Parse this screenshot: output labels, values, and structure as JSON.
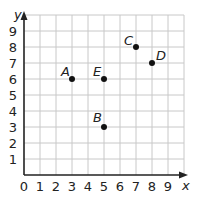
{
  "chart_data": {
    "type": "scatter",
    "title": "",
    "xlabel": "x",
    "ylabel": "y",
    "xlim": [
      0,
      9
    ],
    "ylim": [
      0,
      9
    ],
    "grid": true,
    "x_ticks": [
      "0",
      "1",
      "2",
      "3",
      "4",
      "5",
      "6",
      "7",
      "8",
      "9"
    ],
    "y_ticks": [
      "1",
      "2",
      "3",
      "4",
      "5",
      "6",
      "7",
      "8",
      "9"
    ],
    "points": [
      {
        "label": "A",
        "x": 3,
        "y": 6
      },
      {
        "label": "B",
        "x": 5,
        "y": 3
      },
      {
        "label": "C",
        "x": 7,
        "y": 8
      },
      {
        "label": "D",
        "x": 8,
        "y": 7
      },
      {
        "label": "E",
        "x": 5,
        "y": 6
      }
    ]
  },
  "colors": {
    "grid": "#c8c8c8",
    "axis": "#222222",
    "point": "#111111"
  }
}
